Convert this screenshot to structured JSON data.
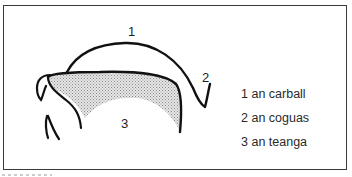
{
  "diagram": {
    "title": "",
    "labels": [
      {
        "number": "1",
        "x": 128,
        "y": 36
      },
      {
        "number": "2",
        "x": 202,
        "y": 82
      },
      {
        "number": "3",
        "x": 121,
        "y": 128
      }
    ],
    "legend": [
      {
        "number": "1",
        "text": "an carball"
      },
      {
        "number": "2",
        "text": "an coguas"
      },
      {
        "number": "3",
        "text": "an teanga"
      }
    ],
    "colors": {
      "line": "#111111",
      "frame": "#3a3a3a",
      "shading": "#bdbdbd"
    }
  }
}
